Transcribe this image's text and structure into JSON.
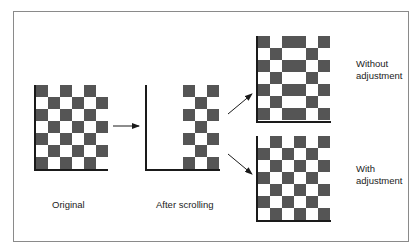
{
  "labels": {
    "original": "Original",
    "after_scrolling": "After scrolling",
    "without_adjustment_1": "Without",
    "without_adjustment_2": "adjustment",
    "with_adjustment_1": "With",
    "with_adjustment_2": "adjustment"
  },
  "colors": {
    "dark": "#555555",
    "light": "#ffffff",
    "axis": "#1a1a1a",
    "frame": "#8a8a8a"
  },
  "grids": {
    "original": {
      "cols": 6,
      "rows": 7,
      "pattern": [
        "DLDLDL",
        "LDLDLD",
        "DLDLDL",
        "LDLDLD",
        "DLDLDL",
        "LDLDLD",
        "DLDLDL"
      ]
    },
    "after_scrolling": {
      "cols": 3,
      "rows": 7,
      "pattern": [
        "DLD",
        "LDL",
        "DLD",
        "LDL",
        "DLD",
        "LDL",
        "DLD"
      ]
    },
    "without_adjustment": {
      "cols": 6,
      "rows": 7,
      "pattern": [
        "DLDDLD",
        "LDLLDL",
        "DLDDLD",
        "LDLLDL",
        "DLDDLD",
        "LDLLDL",
        "DLDDLD"
      ]
    },
    "with_adjustment": {
      "cols": 6,
      "rows": 7,
      "pattern": [
        "LDLDLD",
        "DLDLDL",
        "LDLDLD",
        "DLDLDL",
        "LDLDLD",
        "DLDLDL",
        "LDLDLD"
      ]
    }
  }
}
